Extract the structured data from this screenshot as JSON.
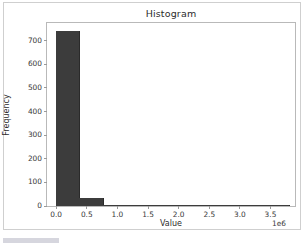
{
  "chart_data": {
    "type": "bar",
    "title": "Histogram",
    "xlabel": "Value",
    "ylabel": "Frequency",
    "x_exponent": "1e6",
    "xlim": [
      -150000,
      3900000
    ],
    "ylim": [
      0,
      775
    ],
    "grid": false,
    "legend": null,
    "bar_color": "#3c3c3c",
    "x_ticks": [
      0.0,
      0.5,
      1.0,
      1.5,
      2.0,
      2.5,
      3.0,
      3.5
    ],
    "x_tick_labels": [
      "0.0",
      "0.5",
      "1.0",
      "1.5",
      "2.0",
      "2.5",
      "3.0",
      "3.5"
    ],
    "y_ticks": [
      0,
      100,
      200,
      300,
      400,
      500,
      600,
      700
    ],
    "y_tick_labels": [
      "0",
      "100",
      "200",
      "300",
      "400",
      "500",
      "600",
      "700"
    ],
    "bin_edges": [
      0,
      380000,
      760000,
      1140000,
      1520000,
      1900000,
      2280000,
      2660000,
      3040000,
      3420000,
      3800000
    ],
    "categories": [
      "0.00-0.38",
      "0.38-0.76",
      "0.76-1.14",
      "1.14-1.52",
      "1.52-1.90",
      "1.90-2.28",
      "2.28-2.66",
      "2.66-3.04",
      "3.04-3.42",
      "3.42-3.80"
    ],
    "values": [
      740,
      32,
      4,
      2,
      1,
      0,
      0,
      0,
      0,
      1
    ]
  },
  "figure": {
    "background": "#ffffff",
    "border_color": "#cfcfcf",
    "axes_border_color": "#b9b9b9"
  }
}
